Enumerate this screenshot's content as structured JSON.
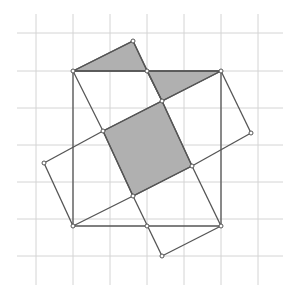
{
  "diagram": {
    "type": "geometry-grid",
    "colors": {
      "background": "#ffffff",
      "grid": "#d4d4d4",
      "edge": "#555555",
      "shade": "#b0b0b0",
      "vertex_fill": "#ffffff"
    },
    "grid": {
      "x_lines": [
        36,
        73,
        110,
        147,
        184,
        221,
        258
      ],
      "y_lines": [
        33,
        71,
        108,
        145,
        182,
        219,
        256
      ],
      "x_extent": [
        17,
        283
      ],
      "y_extent": [
        14,
        285
      ]
    },
    "large_square": [
      [
        73,
        71
      ],
      [
        221,
        71
      ],
      [
        221,
        226
      ],
      [
        73,
        226
      ]
    ],
    "rectangle_a": [
      [
        73,
        71
      ],
      [
        133,
        41
      ],
      [
        251,
        133
      ],
      [
        192,
        166
      ],
      [
        162,
        256
      ],
      [
        103,
        131
      ]
    ],
    "segments": [
      [
        [
          73,
          71
        ],
        [
          133,
          41
        ]
      ],
      [
        [
          133,
          41
        ],
        [
          162,
          101
        ]
      ],
      [
        [
          162,
          101
        ],
        [
          192,
          166
        ]
      ],
      [
        [
          192,
          166
        ],
        [
          221,
          226
        ]
      ],
      [
        [
          221,
          71
        ],
        [
          251,
          133
        ]
      ],
      [
        [
          251,
          133
        ],
        [
          192,
          166
        ]
      ],
      [
        [
          221,
          71
        ],
        [
          103,
          131
        ]
      ],
      [
        [
          103,
          131
        ],
        [
          44,
          163
        ]
      ],
      [
        [
          44,
          163
        ],
        [
          73,
          226
        ]
      ],
      [
        [
          73,
          71
        ],
        [
          103,
          131
        ]
      ],
      [
        [
          103,
          131
        ],
        [
          133,
          196
        ]
      ],
      [
        [
          133,
          196
        ],
        [
          162,
          256
        ]
      ],
      [
        [
          73,
          226
        ],
        [
          133,
          196
        ]
      ],
      [
        [
          133,
          196
        ],
        [
          192,
          166
        ]
      ],
      [
        [
          162,
          256
        ],
        [
          221,
          226
        ]
      ],
      [
        [
          147,
          71
        ],
        [
          162,
          101
        ]
      ],
      [
        [
          73,
          71
        ],
        [
          221,
          71
        ]
      ],
      [
        [
          221,
          71
        ],
        [
          221,
          226
        ]
      ],
      [
        [
          221,
          226
        ],
        [
          73,
          226
        ]
      ],
      [
        [
          73,
          226
        ],
        [
          73,
          71
        ]
      ]
    ],
    "shaded_regions": [
      [
        [
          73,
          71
        ],
        [
          133,
          41
        ],
        [
          147,
          71
        ]
      ],
      [
        [
          147,
          71
        ],
        [
          221,
          71
        ],
        [
          162,
          101
        ]
      ],
      [
        [
          103,
          131
        ],
        [
          162,
          101
        ],
        [
          192,
          166
        ],
        [
          133,
          196
        ]
      ]
    ],
    "vertices": [
      [
        73,
        71
      ],
      [
        133,
        41
      ],
      [
        147,
        71
      ],
      [
        221,
        71
      ],
      [
        162,
        101
      ],
      [
        103,
        131
      ],
      [
        44,
        163
      ],
      [
        251,
        133
      ],
      [
        192,
        166
      ],
      [
        133,
        196
      ],
      [
        73,
        226
      ],
      [
        221,
        226
      ],
      [
        147,
        226
      ],
      [
        162,
        256
      ]
    ]
  }
}
